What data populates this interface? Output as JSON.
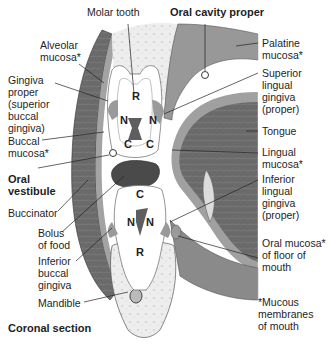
{
  "diagram": {
    "title": "Coronal section",
    "colors": {
      "bone": "#eeeeee",
      "muscle": "#6b6b6b",
      "mucosa": "#9a9a9a",
      "tooth": "#ffffff",
      "pulp": "#5e5e5e",
      "bolus": "#4a4a4a",
      "line": "#222222"
    },
    "tooth_markers": {
      "upper": {
        "root": "R",
        "neck_left": "N",
        "neck_right": "N",
        "crown_left": "C",
        "crown_right": "C"
      },
      "lower": {
        "crown": "C",
        "neck_left": "N",
        "neck_right": "N",
        "root": "R"
      }
    },
    "labels": {
      "molar_tooth": "Molar tooth",
      "oral_cavity_proper": "Oral cavity proper",
      "alveolar_mucosa": "Alveolar\nmucosa*",
      "gingiva_proper": "Gingiva\nproper\n(superior\nbuccal\ngingiva)",
      "buccal_mucosa": "Buccal\nmucosa*",
      "oral_vestibule": "Oral\nvestibule",
      "buccinator": "Buccinator",
      "bolus_of_food": "Bolus\nof food",
      "inferior_buccal_gingiva": "Inferior\nbuccal\ngingiva",
      "mandible": "Mandible",
      "palatine_mucosa": "Palatine\nmucosa*",
      "superior_lingual_gingiva": "Superior\nlingual\ngingiva\n(proper)",
      "tongue": "Tongue",
      "lingual_mucosa": "Lingual\nmucosa*",
      "inferior_lingual_gingiva": "Inferior\nlingual\ngingiva\n(proper)",
      "oral_mucosa_floor": "Oral mucosa*\nof floor of\nmouth",
      "mucous_membranes_note": "*Mucous\nmembranes\nof mouth"
    }
  }
}
